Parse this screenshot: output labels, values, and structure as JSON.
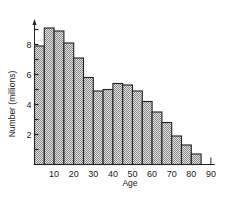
{
  "chart_data": {
    "type": "bar",
    "title": "",
    "xlabel": "Age",
    "ylabel": "Number (millions)",
    "x_tick_labels": [
      "10",
      "20",
      "30",
      "40",
      "50",
      "60",
      "70",
      "80",
      "90"
    ],
    "y_tick_labels": [
      "2",
      "4",
      "6",
      "8"
    ],
    "xlim": [
      0,
      90
    ],
    "ylim": [
      0,
      10
    ],
    "grid": false,
    "legend": null,
    "bin_width": 5,
    "categories": [
      "0-5",
      "5-10",
      "10-15",
      "15-20",
      "20-25",
      "25-30",
      "30-35",
      "35-40",
      "40-45",
      "45-50",
      "50-55",
      "55-60",
      "60-65",
      "65-70",
      "70-75",
      "75-80",
      "80-85"
    ],
    "values": [
      7.9,
      9.1,
      8.9,
      8.1,
      7.1,
      5.8,
      4.9,
      5.0,
      5.4,
      5.3,
      4.9,
      4.2,
      3.5,
      2.8,
      1.9,
      1.3,
      0.7
    ],
    "bar_fill": "#c8c8c8",
    "bar_edge": "#222222"
  }
}
